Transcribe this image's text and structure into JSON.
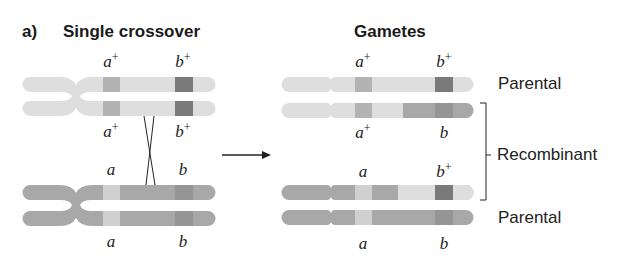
{
  "panel_label": "a)",
  "left_title": "Single crossover",
  "right_title": "Gametes",
  "colors": {
    "light_chrom": "#dedede",
    "dark_chrom": "#a8a8a8",
    "a_plus_band": "#b3b3b3",
    "b_plus_band": "#7a7a7a",
    "a_band": "#d0d0d0",
    "b_band": "#959595"
  },
  "left": {
    "top_labels": {
      "a": "a",
      "a_sup": "+",
      "b": "b",
      "b_sup": "+"
    },
    "mid_top_labels": {
      "a": "a",
      "a_sup": "+",
      "b": "b",
      "b_sup": "+"
    },
    "mid_bottom_labels": {
      "a": "a",
      "b": "b"
    },
    "bottom_labels": {
      "a": "a",
      "b": "b"
    }
  },
  "right": {
    "gametes": [
      {
        "a": "a",
        "a_sup": "+",
        "b": "b",
        "b_sup": "+",
        "type": "Parental"
      },
      {
        "a": "a",
        "a_sup": "+",
        "b": "b",
        "b_sup": "",
        "type": "Recombinant"
      },
      {
        "a": "a",
        "a_sup": "",
        "b": "b",
        "b_sup": "+",
        "type": "Recombinant"
      },
      {
        "a": "a",
        "a_sup": "",
        "b": "b",
        "b_sup": "",
        "type": "Parental"
      }
    ],
    "labels": {
      "parental_top": "Parental",
      "recombinant": "Recombinant",
      "parental_bottom": "Parental"
    }
  }
}
